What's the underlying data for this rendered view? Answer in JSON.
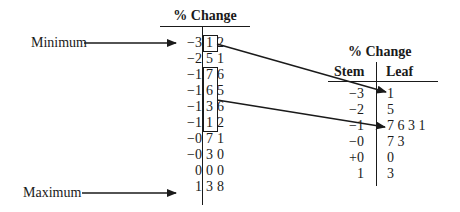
{
  "left_plot": {
    "title": "% Change",
    "annotations": {
      "minimum": "Minimum",
      "maximum": "Maximum"
    },
    "rows": [
      {
        "stem": "−3",
        "leaves": [
          "1",
          "2"
        ]
      },
      {
        "stem": "−2",
        "leaves": [
          "5",
          "1"
        ]
      },
      {
        "stem": "−1",
        "leaves": [
          "7",
          "6"
        ]
      },
      {
        "stem": "−1",
        "leaves": [
          "6",
          "5"
        ]
      },
      {
        "stem": "−1",
        "leaves": [
          "3",
          "6"
        ]
      },
      {
        "stem": "−1",
        "leaves": [
          "1",
          "2"
        ]
      },
      {
        "stem": "−0",
        "leaves": [
          "7",
          "1"
        ]
      },
      {
        "stem": "−0",
        "leaves": [
          "3",
          "0"
        ]
      },
      {
        "stem": "0",
        "leaves": [
          "0",
          "0"
        ]
      },
      {
        "stem": "1",
        "leaves": [
          "3",
          "8"
        ]
      }
    ]
  },
  "right_plot": {
    "title": "% Change",
    "headers": {
      "stem": "Stem",
      "leaf": "Leaf"
    },
    "rows": [
      {
        "stem": "−3",
        "leaf": "1"
      },
      {
        "stem": "−2",
        "leaf": "5"
      },
      {
        "stem": "−1",
        "leaf": "7 6 3 1"
      },
      {
        "stem": "−0",
        "leaf": "7 3"
      },
      {
        "stem": "+0",
        "leaf": "0"
      },
      {
        "stem": "1",
        "leaf": "3"
      }
    ]
  },
  "colors": {
    "ink": "#1a1a1a",
    "background": "#ffffff"
  }
}
